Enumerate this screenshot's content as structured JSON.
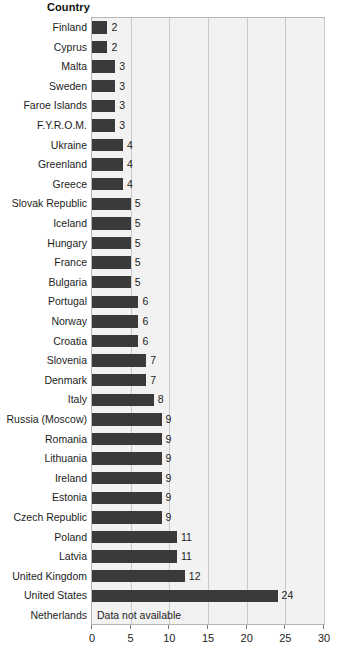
{
  "header": {
    "column_title": "Country"
  },
  "chart_data": {
    "type": "bar",
    "orientation": "horizontal",
    "title": "",
    "xlabel": "",
    "ylabel": "Country",
    "xlim": [
      0,
      30
    ],
    "xticks": [
      0,
      5,
      10,
      15,
      20,
      25,
      30
    ],
    "grid": true,
    "legend": false,
    "bar_color": "#3a3a3a",
    "plot_background": "#f2f2f2",
    "categories": [
      "Finland",
      "Cyprus",
      "Malta",
      "Sweden",
      "Faroe Islands",
      "F.Y.R.O.M.",
      "Ukraine",
      "Greenland",
      "Greece",
      "Slovak Republic",
      "Iceland",
      "Hungary",
      "France",
      "Bulgaria",
      "Portugal",
      "Norway",
      "Croatia",
      "Slovenia",
      "Denmark",
      "Italy",
      "Russia (Moscow)",
      "Romania",
      "Lithuania",
      "Ireland",
      "Estonia",
      "Czech Republic",
      "Poland",
      "Latvia",
      "United Kingdom",
      "United States",
      "Netherlands"
    ],
    "values": [
      2,
      2,
      3,
      3,
      3,
      3,
      4,
      4,
      4,
      5,
      5,
      5,
      5,
      5,
      6,
      6,
      6,
      7,
      7,
      8,
      9,
      9,
      9,
      9,
      9,
      9,
      11,
      11,
      12,
      24,
      null
    ],
    "data_labels": [
      "2",
      "2",
      "3",
      "3",
      "3",
      "3",
      "4",
      "4",
      "4",
      "5",
      "5",
      "5",
      "5",
      "5",
      "6",
      "6",
      "6",
      "7",
      "7",
      "8",
      "9",
      "9",
      "9",
      "9",
      "9",
      "9",
      "11",
      "11",
      "12",
      "24",
      ""
    ],
    "annotations": [
      {
        "category": "Netherlands",
        "text": "Data not available"
      }
    ]
  }
}
